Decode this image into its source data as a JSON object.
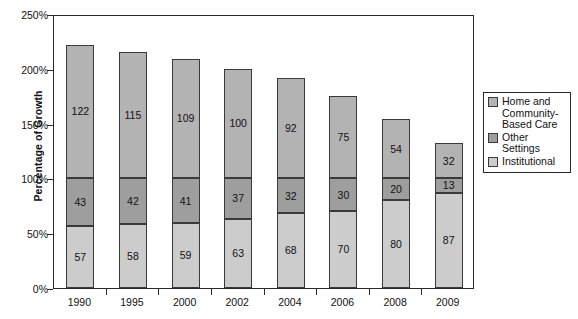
{
  "chart_data": {
    "type": "bar",
    "subtype": "stacked-bar",
    "title": "",
    "xlabel": "",
    "ylabel": "Percentage of Growth",
    "categories": [
      "1990",
      "1995",
      "2000",
      "2002",
      "2004",
      "2006",
      "2008",
      "2009"
    ],
    "series": [
      {
        "name": "Institutional",
        "values": [
          57,
          58,
          59,
          63,
          68,
          70,
          80,
          87
        ],
        "color": "#cccccc"
      },
      {
        "name": "Other Settings",
        "values": [
          43,
          42,
          41,
          37,
          32,
          30,
          20,
          13
        ],
        "color": "#9e9e9e"
      },
      {
        "name": "Home and Community-Based Care",
        "values": [
          122,
          115,
          109,
          100,
          92,
          75,
          54,
          32
        ],
        "color": "#b3b3b3"
      }
    ],
    "totals": [
      222,
      215,
      209,
      200,
      192,
      175,
      154,
      132
    ],
    "ylim": [
      0,
      250
    ],
    "yticks": [
      0,
      50,
      100,
      150,
      200,
      250
    ],
    "ytick_labels": [
      "0%",
      "50%",
      "100%",
      "150%",
      "200%",
      "250%"
    ],
    "grid": false,
    "legend_position": "right",
    "legend_entries": [
      "Home and\nCommunity-\nBased Care",
      "Other Settings",
      "Institutional"
    ],
    "legend_colors": [
      "#b3b3b3",
      "#9e9e9e",
      "#cccccc"
    ]
  },
  "axis": {
    "frame_color": "#2a2a2a",
    "bar_outline_color": "#3a3a3a"
  }
}
